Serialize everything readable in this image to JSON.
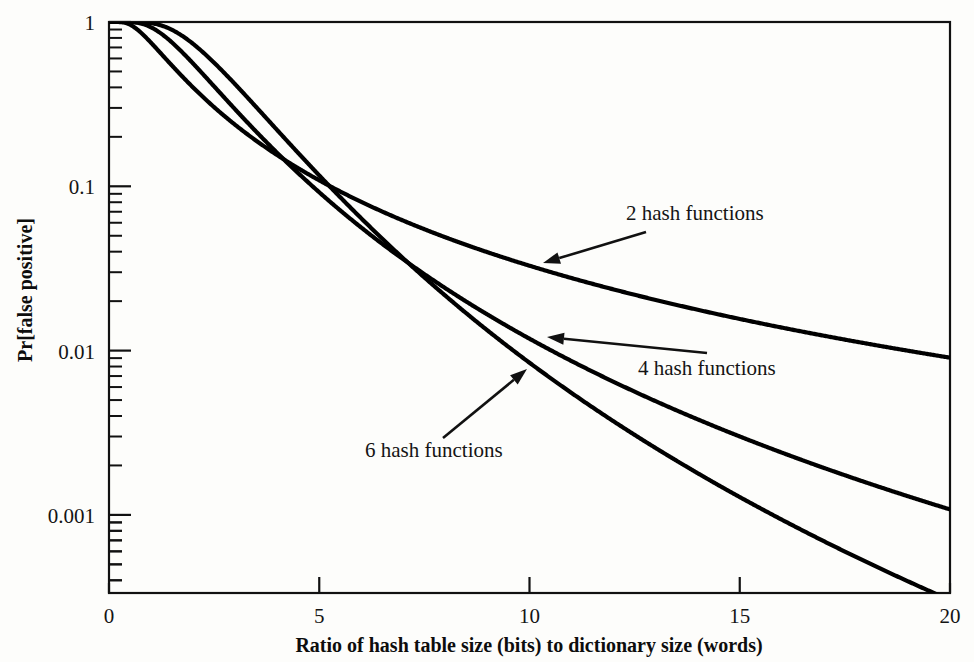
{
  "chart_data": {
    "type": "line",
    "title": "",
    "xlabel": "Ratio of hash table size (bits) to dictionary size (words)",
    "ylabel": "Pr[false positive]",
    "xlim": [
      0,
      20
    ],
    "ylim": [
      0.0003,
      1
    ],
    "yscale": "log",
    "xscale": "linear",
    "grid": false,
    "legend_position": "inline-annotations",
    "xticks": [
      "0",
      "5",
      "10",
      "15",
      "20"
    ],
    "xtick_values": [
      0,
      5,
      10,
      15,
      20
    ],
    "yticks": [
      "1",
      "0.1",
      "0.01",
      "0.001"
    ],
    "ytick_values": [
      1,
      0.1,
      0.01,
      0.001
    ],
    "minor_ticks": "log decades (2..9 per decade) on y axis",
    "line_color": "#000000",
    "series": [
      {
        "name": "2 hash functions",
        "k": 2,
        "x": [
          0,
          0.5,
          1,
          1.5,
          2,
          2.5,
          3,
          3.5,
          4,
          4.5,
          5,
          5.5,
          6,
          6.5,
          7,
          7.5,
          8,
          8.5,
          9,
          9.5,
          10,
          11,
          12,
          13,
          14,
          15,
          16,
          17,
          18,
          19,
          20
        ],
        "values": [
          1,
          0.9389,
          0.7995,
          0.6501,
          0.5186,
          0.4109,
          0.3251,
          0.2577,
          0.2048,
          0.1634,
          0.1308,
          0.1051,
          0.0847,
          0.0686,
          0.0557,
          0.0454,
          0.0371,
          0.0305,
          0.0251,
          0.0207,
          0.0171,
          0.0118,
          0.00822,
          0.00576,
          0.00406,
          0.00287,
          0.00204,
          0.00145,
          0.00104,
          0.00075,
          0.00054
        ]
      },
      {
        "name": "4 hash functions",
        "k": 4,
        "x": [
          0,
          0.5,
          1,
          1.5,
          2,
          2.5,
          3,
          3.5,
          4,
          4.5,
          5,
          5.5,
          6,
          6.5,
          7,
          7.5,
          8,
          8.5,
          9,
          9.5,
          10,
          11,
          12,
          13,
          14,
          15,
          16,
          17,
          18,
          19,
          20
        ],
        "values": [
          1,
          0.9995,
          0.9817,
          0.912,
          0.7895,
          0.6427,
          0.5,
          0.3769,
          0.2785,
          0.2027,
          0.146,
          0.1043,
          0.074,
          0.0522,
          0.0367,
          0.0257,
          0.018,
          0.0125,
          0.00872,
          0.00606,
          0.00421,
          0.00203,
          0.000977,
          0.00047,
          0.000226,
          0.000109,
          5.22e-05,
          2.51e-05,
          1.2e-05,
          5.8e-06,
          2.8e-06
        ]
      },
      {
        "name": "6 hash functions",
        "k": 6,
        "x": [
          0,
          0.5,
          1,
          1.5,
          2,
          2.5,
          3,
          3.5,
          4,
          4.5,
          5,
          5.5,
          6,
          6.5,
          7,
          7.5,
          8,
          8.5,
          9,
          9.5,
          10,
          11,
          12,
          13,
          14,
          15,
          16,
          17,
          18,
          19,
          20
        ],
        "values": [
          1,
          1.0,
          0.9993,
          0.9904,
          0.9461,
          0.8467,
          0.7056,
          0.5519,
          0.4094,
          0.2891,
          0.1971,
          0.1306,
          0.0846,
          0.0538,
          0.0337,
          0.0208,
          0.0127,
          0.00772,
          0.00466,
          0.00279,
          0.00166,
          0.000588,
          0.000206,
          7.15e-05,
          2.47e-05,
          8.5e-06,
          2.9e-06,
          1e-06,
          3.4e-07,
          1.2e-07,
          4e-08
        ]
      }
    ],
    "annotations": [
      {
        "text": "2 hash functions",
        "label_x": 626,
        "label_y": 220,
        "arrow_from_x": 646,
        "arrow_from_y": 232,
        "arrow_to_x": 543,
        "arrow_to_y": 263
      },
      {
        "text": "4 hash functions",
        "label_x": 638,
        "label_y": 375,
        "arrow_from_x": 707,
        "arrow_from_y": 353,
        "arrow_to_x": 547,
        "arrow_to_y": 337
      },
      {
        "text": "6 hash functions",
        "label_x": 365,
        "label_y": 457,
        "arrow_from_x": 443,
        "arrow_from_y": 438,
        "arrow_to_x": 527,
        "arrow_to_y": 369
      }
    ]
  }
}
